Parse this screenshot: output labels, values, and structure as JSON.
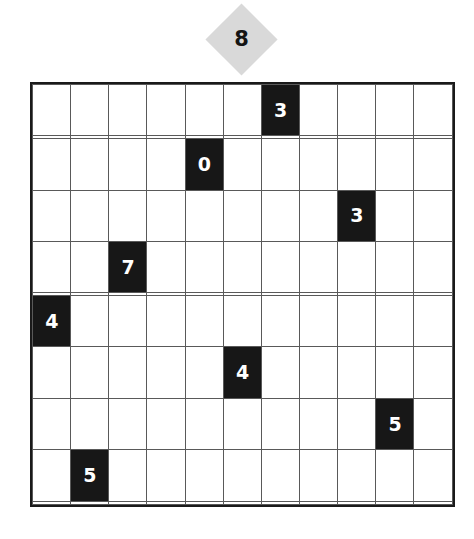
{
  "puzzle": {
    "grid": {
      "rows": 11,
      "columns": 11,
      "cell_size_px": 38.6,
      "left_px": 30,
      "top_px": 82,
      "background_color": "#ffffff",
      "border_color": "#1a1a1a",
      "line_color": "#595959",
      "filled_cell_color": "#171717",
      "filled_text_color": "#ffffff",
      "cells": [
        [
          null,
          null,
          null,
          null,
          null,
          null,
          "3",
          null,
          null,
          null,
          null
        ],
        [
          null,
          null,
          null,
          null,
          null,
          null,
          null,
          null,
          null,
          null,
          null
        ],
        [
          null,
          null,
          null,
          null,
          "0",
          null,
          null,
          null,
          null,
          null,
          null
        ],
        [
          null,
          null,
          null,
          null,
          null,
          null,
          null,
          null,
          "3",
          null,
          null
        ],
        [
          null,
          null,
          "7",
          null,
          null,
          null,
          null,
          null,
          null,
          null,
          null
        ],
        [
          null,
          null,
          null,
          null,
          null,
          null,
          null,
          null,
          null,
          null,
          null
        ],
        [
          "4",
          null,
          null,
          null,
          null,
          null,
          null,
          null,
          null,
          null,
          null
        ],
        [
          null,
          null,
          null,
          null,
          null,
          "4",
          null,
          null,
          null,
          null,
          null
        ],
        [
          null,
          null,
          null,
          null,
          null,
          null,
          null,
          null,
          null,
          "5",
          null
        ],
        [
          null,
          "5",
          null,
          null,
          null,
          null,
          null,
          null,
          null,
          null,
          null
        ],
        [
          null,
          null,
          null,
          null,
          null,
          null,
          null,
          null,
          null,
          null,
          null
        ]
      ]
    },
    "clue_marker": {
      "value": "8",
      "shape": "diamond",
      "fill_color": "#d9d9d9",
      "text_color": "#141414",
      "center_x_px": 241,
      "center_y_px": 39,
      "points_to_column": 6
    }
  }
}
